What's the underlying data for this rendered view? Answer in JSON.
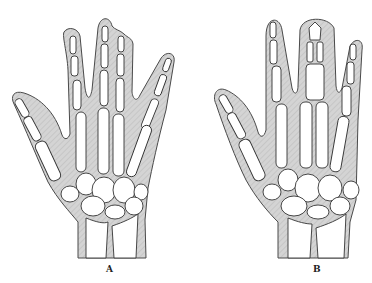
{
  "figure": {
    "panels": [
      {
        "id": "A",
        "label": "A",
        "description": "Hand with fused middle and ring finger soft tissue (syndactyly)"
      },
      {
        "id": "B",
        "label": "B",
        "description": "Hand with central fingers enclosed in a single soft-tissue mass"
      }
    ],
    "colors": {
      "skin": "#cfcfcf",
      "outline": "#4a4a4a",
      "bone": "#ffffff"
    }
  }
}
